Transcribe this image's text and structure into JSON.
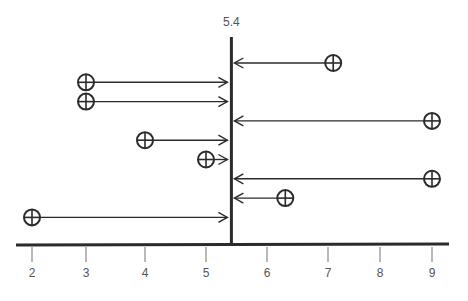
{
  "chart_data": {
    "type": "scatter",
    "title": "",
    "xlabel": "",
    "ylabel": "",
    "x_ticks": [
      2,
      3,
      4,
      5,
      6,
      7,
      8,
      9
    ],
    "x_tick_labels": [
      "2",
      "3",
      "4",
      "5",
      "6",
      "7",
      "8",
      "9"
    ],
    "xlim": [
      1.7,
      9.3
    ],
    "reference_line": {
      "value": 5.4,
      "label": "5.4"
    },
    "grid": false,
    "legend": "none",
    "points": [
      {
        "x": 7.1,
        "direction": "left"
      },
      {
        "x": 3.0,
        "direction": "right"
      },
      {
        "x": 3.0,
        "direction": "right"
      },
      {
        "x": 9.0,
        "direction": "left"
      },
      {
        "x": 4.0,
        "direction": "right"
      },
      {
        "x": 5.0,
        "direction": "right"
      },
      {
        "x": 9.0,
        "direction": "left"
      },
      {
        "x": 6.3,
        "direction": "left"
      },
      {
        "x": 2.0,
        "direction": "right"
      }
    ],
    "marker": "circle-plus",
    "colors": {
      "ink": "#2b2b2b",
      "tick": "#8a8a8a",
      "label": "#555555"
    }
  }
}
